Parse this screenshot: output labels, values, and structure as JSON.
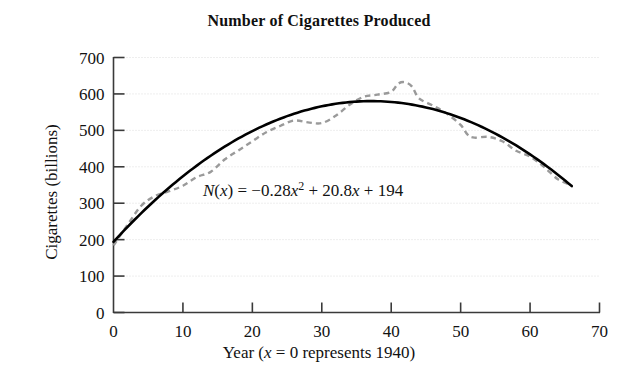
{
  "chart_data": {
    "type": "line",
    "title": "Number of Cigarettes Produced",
    "xlabel": "Year (x = 0 represents 1940)",
    "xlabel_parts": {
      "lead": "Year (",
      "var": "x",
      "rest": " = 0 represents 1940)"
    },
    "ylabel": "Cigarettes (billions)",
    "xlim": [
      0,
      70
    ],
    "ylim": [
      0,
      700
    ],
    "xticks": [
      0,
      10,
      20,
      30,
      40,
      50,
      60,
      70
    ],
    "yticks": [
      0,
      100,
      200,
      300,
      400,
      500,
      600,
      700
    ],
    "xtick_labels": [
      "0",
      "10",
      "20",
      "30",
      "40",
      "50",
      "60",
      "70"
    ],
    "ytick_labels": [
      "0",
      "100",
      "200",
      "300",
      "400",
      "500",
      "600",
      "700"
    ],
    "grid": "horizontal-dotted",
    "legend": "none",
    "annotations": [
      {
        "name": "model-equation",
        "text": "N(x) = −0.28x² + 20.8x + 194",
        "x": 13,
        "y": 300,
        "parts": {
          "fn": "N",
          "open": "(",
          "arg": "x",
          "close": ")",
          "eq": " = −0.28",
          "v1": "x",
          "sup": "2",
          "mid": " + 20.8",
          "v2": "x",
          "tail": " + 194"
        }
      }
    ],
    "series": [
      {
        "name": "Model N(x)",
        "style": "solid",
        "color": "#000000",
        "equation": "N(x) = -0.28x^2 + 20.8x + 194",
        "coefficients": {
          "a": -0.28,
          "b": 20.8,
          "c": 194
        },
        "x_range": [
          0,
          66
        ],
        "points": [
          {
            "x": 0,
            "y": 194
          },
          {
            "x": 5,
            "y": 291
          },
          {
            "x": 10,
            "y": 374
          },
          {
            "x": 15,
            "y": 443
          },
          {
            "x": 20,
            "y": 498
          },
          {
            "x": 25,
            "y": 539
          },
          {
            "x": 30,
            "y": 566
          },
          {
            "x": 35,
            "y": 579
          },
          {
            "x": 37,
            "y": 581
          },
          {
            "x": 40,
            "y": 578
          },
          {
            "x": 45,
            "y": 562
          },
          {
            "x": 50,
            "y": 534
          },
          {
            "x": 55,
            "y": 490
          },
          {
            "x": 60,
            "y": 434
          },
          {
            "x": 66,
            "y": 345
          }
        ]
      },
      {
        "name": "Actual data",
        "style": "dashed",
        "color": "#9a9a9a",
        "x_range": [
          0,
          66
        ],
        "points": [
          {
            "x": 0,
            "y": 184
          },
          {
            "x": 2,
            "y": 240
          },
          {
            "x": 4,
            "y": 293
          },
          {
            "x": 6,
            "y": 320
          },
          {
            "x": 8,
            "y": 333
          },
          {
            "x": 10,
            "y": 348
          },
          {
            "x": 12,
            "y": 372
          },
          {
            "x": 14,
            "y": 386
          },
          {
            "x": 16,
            "y": 420
          },
          {
            "x": 18,
            "y": 445
          },
          {
            "x": 20,
            "y": 470
          },
          {
            "x": 22,
            "y": 495
          },
          {
            "x": 24,
            "y": 512
          },
          {
            "x": 26,
            "y": 527
          },
          {
            "x": 28,
            "y": 522
          },
          {
            "x": 30,
            "y": 520
          },
          {
            "x": 32,
            "y": 540
          },
          {
            "x": 34,
            "y": 570
          },
          {
            "x": 36,
            "y": 592
          },
          {
            "x": 38,
            "y": 598
          },
          {
            "x": 40,
            "y": 606
          },
          {
            "x": 41,
            "y": 628
          },
          {
            "x": 42,
            "y": 632
          },
          {
            "x": 43,
            "y": 620
          },
          {
            "x": 44,
            "y": 588
          },
          {
            "x": 46,
            "y": 568
          },
          {
            "x": 48,
            "y": 546
          },
          {
            "x": 50,
            "y": 515
          },
          {
            "x": 51,
            "y": 488
          },
          {
            "x": 52,
            "y": 480
          },
          {
            "x": 54,
            "y": 482
          },
          {
            "x": 56,
            "y": 470
          },
          {
            "x": 58,
            "y": 444
          },
          {
            "x": 60,
            "y": 428
          },
          {
            "x": 62,
            "y": 400
          },
          {
            "x": 64,
            "y": 366
          },
          {
            "x": 66,
            "y": 349
          }
        ]
      }
    ]
  }
}
